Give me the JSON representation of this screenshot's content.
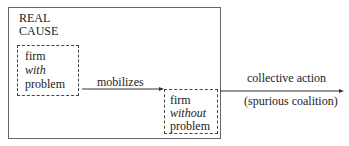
{
  "diagram": {
    "outer_box_label": [
      "REAL",
      "CAUSE"
    ],
    "node_with": {
      "line1": "firm",
      "line2": "with",
      "line3": "problem"
    },
    "node_without": {
      "line1": "firm",
      "line2": "without",
      "line3": "problem"
    },
    "edge_mobilizes": "mobilizes",
    "edge_out_top": "collective action",
    "edge_out_bottom": "(spurious coalition)"
  }
}
